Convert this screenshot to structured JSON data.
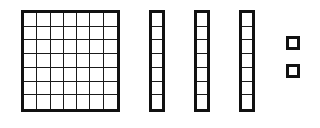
{
  "diagram": {
    "type": "place-value-blocks",
    "stroke_color": "#111111",
    "background": "#ffffff",
    "square_grid": {
      "rows": 7,
      "cols": 7,
      "cells": 49
    },
    "strips": [
      {
        "cells": 7
      },
      {
        "cells": 7
      },
      {
        "cells": 7
      }
    ],
    "units": [
      {
        "cells": 1
      },
      {
        "cells": 1
      }
    ]
  }
}
